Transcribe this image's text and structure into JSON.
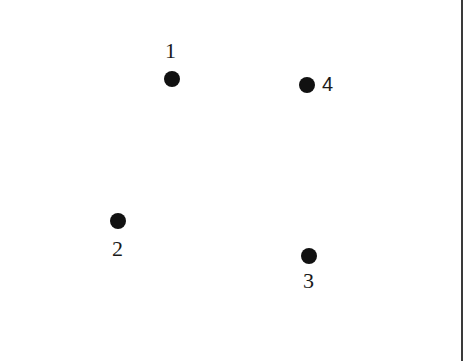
{
  "diagram": {
    "type": "point-set",
    "points": [
      {
        "id": "1",
        "label": "1",
        "x": 172,
        "y": 79,
        "label_position": "above"
      },
      {
        "id": "2",
        "label": "2",
        "x": 118,
        "y": 221,
        "label_position": "below"
      },
      {
        "id": "3",
        "label": "3",
        "x": 309,
        "y": 256,
        "label_position": "below"
      },
      {
        "id": "4",
        "label": "4",
        "x": 307,
        "y": 85,
        "label_position": "right"
      }
    ],
    "colors": {
      "dot": "#111111",
      "background": "#ffffff",
      "border": "#3a3a3a"
    }
  }
}
